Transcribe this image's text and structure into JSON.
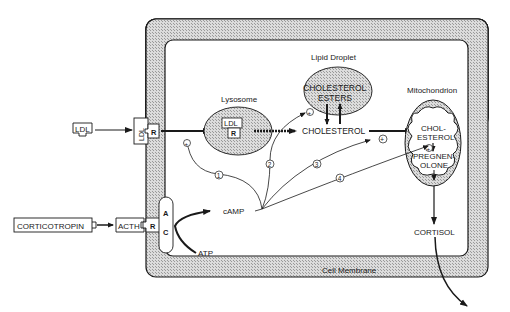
{
  "diagram": {
    "membrane_label": "Cell Membrane",
    "lysosome": {
      "label": "Lysosome",
      "ldl": "LDL",
      "r": "R"
    },
    "lipid_droplet": {
      "label": "Lipid Droplet",
      "line1": "CHOLESTEROL",
      "line2": "ESTERS"
    },
    "mitochondrion": {
      "label": "Mitochondrion",
      "chol1": "CHOL-",
      "chol2": "ESTEROL",
      "preg1": "PREGNEN-",
      "preg2": "OLONE"
    },
    "cholesterol": "CHOLESTEROL",
    "cortisol": "CORTISOL",
    "camp": "cAMP",
    "atp": "ATP",
    "ldl_outside": "LDL",
    "ldl_receptor": {
      "ldl": "LDL",
      "r": "R"
    },
    "corticotropin": "CORTICOTROPIN",
    "acth_receptor": {
      "acth": "ACTH",
      "r": "R"
    },
    "adenylate_cyclase": {
      "a": "A",
      "c": "C"
    },
    "pathways": [
      "1",
      "2",
      "3",
      "4"
    ],
    "plus": "+",
    "colors": {
      "stroke": "#1a1a1a",
      "membrane_fill": "#c8c8c8",
      "organelle_fill": "#bdbdbd",
      "background": "#ffffff"
    }
  }
}
